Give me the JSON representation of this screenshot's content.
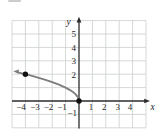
{
  "figure": {
    "x_axis_label": "x",
    "y_axis_label": "y",
    "x_tick_labels_negative": [
      "−4",
      "−3",
      "−2",
      "−1"
    ],
    "x_tick_labels_positive": [
      "1",
      "2",
      "3",
      "4"
    ],
    "y_tick_labels": [
      "5",
      "4",
      "3",
      "2"
    ],
    "y_tick_label_negative": "−1"
  },
  "chart_data": {
    "type": "line",
    "title": "",
    "xlabel": "x",
    "ylabel": "y",
    "x_ticks": [
      -4,
      -3,
      -2,
      -1,
      1,
      2,
      3,
      4
    ],
    "y_ticks_labeled": [
      5,
      4,
      3,
      2,
      -1
    ],
    "xlim": [
      -5,
      5
    ],
    "ylim": [
      -2,
      6
    ],
    "grid": true,
    "legend": false,
    "curve_description": "square-root curve opening up-left from origin, continuing with arrow past x = -4",
    "curve_points": [
      [
        -4.55,
        2.133
      ],
      [
        -4.25,
        2.062
      ],
      [
        -4,
        2
      ],
      [
        -3.5,
        1.871
      ],
      [
        -3,
        1.732
      ],
      [
        -2.5,
        1.581
      ],
      [
        -2,
        1.414
      ],
      [
        -1.5,
        1.225
      ],
      [
        -1,
        1
      ],
      [
        -0.7,
        0.837
      ],
      [
        -0.45,
        0.671
      ],
      [
        -0.25,
        0.5
      ],
      [
        -0.1,
        0.316
      ],
      [
        -0.03,
        0.173
      ],
      [
        0,
        0
      ]
    ],
    "marked_points": [
      [
        -4,
        2
      ],
      [
        0,
        0
      ]
    ],
    "arrows": [
      "left end of curve",
      "top of y-axis",
      "right end of x-axis"
    ],
    "colors": {
      "curve": "#7e7e7e",
      "axis": "#2b2b2b",
      "grid": "#c9cfc9",
      "points": "#111111",
      "background": "#ffffff"
    }
  }
}
